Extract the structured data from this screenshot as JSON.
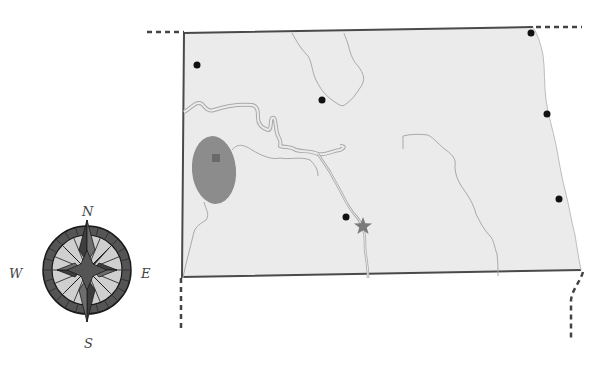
{
  "map": {
    "region": "North Dakota outline map",
    "colors": {
      "land": "#ebebeb",
      "border": "#4a4a4a",
      "dashed_border": "#444444",
      "river": "#a9a9a9",
      "river_fill": "#e4e4e4",
      "highlight_area": "#8c8c8c",
      "highlight_square": "#6a6a6a",
      "city_dot": "#111111",
      "star": "#7a7a7a"
    },
    "markers": [
      {
        "type": "dot",
        "name": "city-dot-northwest",
        "x": 197,
        "y": 65
      },
      {
        "type": "dot",
        "name": "city-dot-north-central",
        "x": 322,
        "y": 100
      },
      {
        "type": "dot",
        "name": "city-dot-northeast-corner",
        "x": 531,
        "y": 33
      },
      {
        "type": "dot",
        "name": "city-dot-east",
        "x": 547,
        "y": 114
      },
      {
        "type": "dot",
        "name": "city-dot-southeast",
        "x": 559,
        "y": 199
      },
      {
        "type": "dot",
        "name": "city-dot-central",
        "x": 346,
        "y": 217
      },
      {
        "type": "star",
        "name": "capital-star",
        "x": 363,
        "y": 226
      },
      {
        "type": "square",
        "name": "highlight-square",
        "x": 216,
        "y": 158
      }
    ]
  },
  "compass": {
    "north": "N",
    "south": "S",
    "east": "E",
    "west": "W",
    "colors": {
      "ring_outer": "#555555",
      "ring_inner": "#cfcfcf",
      "star_dark": "#3e3e3e",
      "star_mid": "#6e6e6e",
      "stroke": "#1a1a1a"
    }
  }
}
